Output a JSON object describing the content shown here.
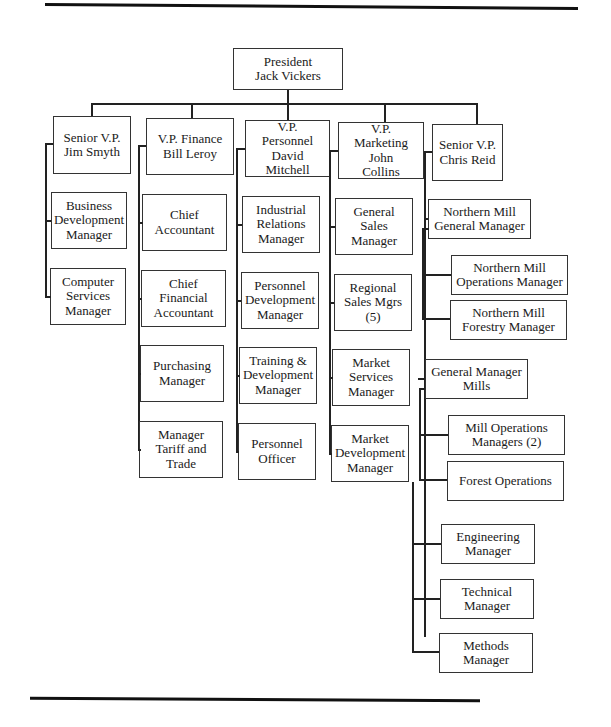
{
  "chart": {
    "president": {
      "title": "President",
      "name": "Jack Vickers"
    },
    "columns": [
      {
        "head": "Senior V.P.\nJim Smyth",
        "reports": [
          "Business\nDevelopment\nManager",
          "Computer\nServices\nManager"
        ]
      },
      {
        "head": "V.P. Finance\nBill Leroy",
        "reports": [
          "Chief\nAccountant",
          "Chief\nFinancial\nAccountant",
          "Purchasing\nManager",
          "Manager\nTariff and\nTrade"
        ]
      },
      {
        "head": "V.P.\nPersonnel\nDavid\nMitchell",
        "reports": [
          "Industrial\nRelations\nManager",
          "Personnel\nDevelopment\nManager",
          "Training &\nDevelopment\nManager",
          "Personnel\nOfficer"
        ]
      },
      {
        "head": "V.P.\nMarketing\nJohn\nCollins",
        "reports": [
          "General\nSales\nManager",
          "Regional\nSales Mgrs\n(5)",
          "Market\nServices\nManager",
          "Market\nDevelopment\nManager"
        ]
      },
      {
        "head": "Senior V.P.\nChris Reid",
        "reports": [
          {
            "label": "Northern Mill\nGeneral Manager",
            "reports": [
              "Northern Mill\nOperations Manager",
              "Northern Mill\nForestry Manager"
            ]
          },
          {
            "label": "General Manager\nMills",
            "reports": [
              "Mill Operations\nManagers (2)",
              "Forest Operations"
            ]
          },
          "Engineering\nManager",
          "Technical\nManager",
          "Methods\nManager"
        ]
      }
    ]
  },
  "labels": {
    "president": "President\nJack Vickers",
    "c1_head": "Senior V.P.\nJim Smyth",
    "c1_r1": "Business\nDevelopment\nManager",
    "c1_r2": "Computer\nServices\nManager",
    "c2_head": "V.P. Finance\nBill Leroy",
    "c2_r1": "Chief\nAccountant",
    "c2_r2": "Chief\nFinancial\nAccountant",
    "c2_r3": "Purchasing\nManager",
    "c2_r4": "Manager\nTariff and\nTrade",
    "c3_head": "V.P.\nPersonnel\nDavid\nMitchell",
    "c3_r1": "Industrial\nRelations\nManager",
    "c3_r2": "Personnel\nDevelopment\nManager",
    "c3_r3": "Training &\nDevelopment\nManager",
    "c3_r4": "Personnel\nOfficer",
    "c4_head": "V.P.\nMarketing\nJohn\nCollins",
    "c4_r1": "General\nSales\nManager",
    "c4_r2": "Regional\nSales Mgrs\n(5)",
    "c4_r3": "Market\nServices\nManager",
    "c4_r4": "Market\nDevelopment\nManager",
    "c5_head": "Senior V.P.\nChris Reid",
    "c5_nmgm": "Northern Mill\nGeneral Manager",
    "c5_nmom": "Northern Mill\nOperations Manager",
    "c5_nmfm": "Northern Mill\nForestry Manager",
    "c5_gmm": "General Manager\nMills",
    "c5_mom": "Mill Operations\nManagers (2)",
    "c5_fo": "Forest Operations",
    "c5_eng": "Engineering\nManager",
    "c5_tech": "Technical\nManager",
    "c5_meth": "Methods\nManager"
  }
}
